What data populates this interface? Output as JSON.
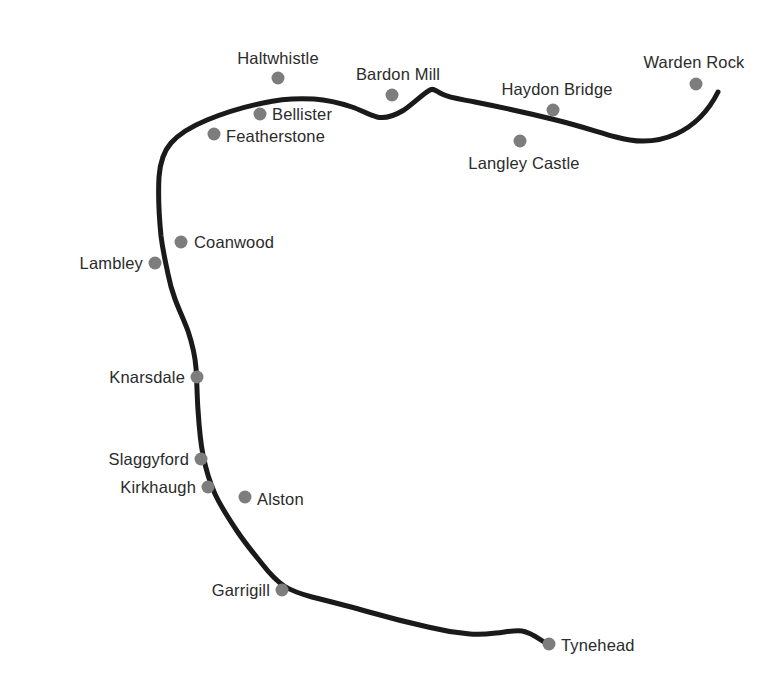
{
  "map": {
    "title": "South Tyne Valley route map",
    "background_color": "#ffffff",
    "route": {
      "name": "South Tyne river / railway route line",
      "stroke_color": "#1a1a1a",
      "stroke_width": 5,
      "path": "M 718 92 C 710 108 698 124 676 134 C 652 145 630 141 616 137 C 598 132 580 126 556 120 C 528 113 500 107 475 102 C 460 99 450 98 442 94 C 436 91 434 88 430 90 C 424 93 414 103 404 110 C 394 116 385 119 377 117 C 369 115 361 110 352 107 C 340 103 328 100 314 99 C 296 98 280 99 263 103 C 243 107 224 113 207 120 C 190 127 178 135 171 143 C 163 152 160 163 159 177 C 158 196 159 216 161 236 C 163 252 166 264 168 274 C 170 284 172 291 175 299 C 179 310 184 320 188 331 C 192 343 195 355 196 368 C 197 382 197 396 198 410 C 199 425 200 440 203 455 C 206 470 210 483 215 494 C 221 507 229 519 237 531 C 245 543 254 554 263 565 C 270 574 277 581 284 586 C 292 591 301 594 312 597 C 328 601 348 606 369 612 C 390 618 410 623 428 627 C 444 631 458 633 470 634 C 480 635 488 634 496 633 C 506 632 514 630 522 631 C 529 632 535 636 541 640 C 544 642 546 643 548 644"
    },
    "places": [
      {
        "name": "Haltwhistle",
        "dot_x": 278,
        "dot_y": 78,
        "label_x": 278,
        "label_y": 58,
        "label_anchor": "center"
      },
      {
        "name": "Bardon Mill",
        "dot_x": 392,
        "dot_y": 95,
        "label_x": 398,
        "label_y": 74,
        "label_anchor": "center"
      },
      {
        "name": "Warden Rock",
        "dot_x": 696,
        "dot_y": 84,
        "label_x": 694,
        "label_y": 62,
        "label_anchor": "center"
      },
      {
        "name": "Haydon Bridge",
        "dot_x": 553,
        "dot_y": 110,
        "label_x": 557,
        "label_y": 89,
        "label_anchor": "center"
      },
      {
        "name": "Bellister",
        "dot_x": 260,
        "dot_y": 114,
        "label_x": 272,
        "label_y": 114,
        "label_anchor": "right"
      },
      {
        "name": "Featherstone",
        "dot_x": 214,
        "dot_y": 134,
        "label_x": 226,
        "label_y": 136,
        "label_anchor": "right"
      },
      {
        "name": "Langley Castle",
        "dot_x": 520,
        "dot_y": 141,
        "label_x": 524,
        "label_y": 163,
        "label_anchor": "center"
      },
      {
        "name": "Coanwood",
        "dot_x": 181,
        "dot_y": 242,
        "label_x": 194,
        "label_y": 242,
        "label_anchor": "right"
      },
      {
        "name": "Lambley",
        "dot_x": 155,
        "dot_y": 263,
        "label_x": 143,
        "label_y": 263,
        "label_anchor": "left"
      },
      {
        "name": "Knarsdale",
        "dot_x": 197,
        "dot_y": 377,
        "label_x": 185,
        "label_y": 377,
        "label_anchor": "left"
      },
      {
        "name": "Slaggyford",
        "dot_x": 201,
        "dot_y": 459,
        "label_x": 189,
        "label_y": 459,
        "label_anchor": "left"
      },
      {
        "name": "Kirkhaugh",
        "dot_x": 208,
        "dot_y": 487,
        "label_x": 196,
        "label_y": 487,
        "label_anchor": "left"
      },
      {
        "name": "Alston",
        "dot_x": 245,
        "dot_y": 497,
        "label_x": 257,
        "label_y": 499,
        "label_anchor": "right"
      },
      {
        "name": "Garrigill",
        "dot_x": 282,
        "dot_y": 590,
        "label_x": 270,
        "label_y": 590,
        "label_anchor": "left"
      },
      {
        "name": "Tynehead",
        "dot_x": 549,
        "dot_y": 644,
        "label_x": 561,
        "label_y": 645,
        "label_anchor": "right"
      }
    ],
    "marker_color": "#7d7d7d",
    "label_color": "#2b2b2b"
  }
}
